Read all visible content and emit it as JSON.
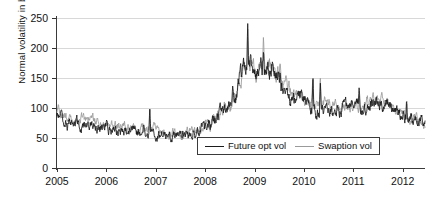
{
  "chart_data": {
    "type": "line",
    "title": "",
    "xlabel": "",
    "ylabel": "Normal volatility in bp",
    "xlim": [
      2005.0,
      2012.45
    ],
    "ylim": [
      0,
      250
    ],
    "grid": true,
    "legend_position": "bottom-center",
    "x_ticks": [
      "2005",
      "2006",
      "2007",
      "2008",
      "2009",
      "2010",
      "2011",
      "2012"
    ],
    "x_tick_values": [
      2005,
      2006,
      2007,
      2008,
      2009,
      2010,
      2011,
      2012
    ],
    "y_ticks": [
      "0",
      "50",
      "100",
      "150",
      "200",
      "250"
    ],
    "y_tick_values": [
      0,
      50,
      100,
      150,
      200,
      250
    ],
    "series": [
      {
        "name": "Future opt vol",
        "color": "#1b1b1b",
        "x": [
          2005.0,
          2005.04,
          2005.08,
          2005.12,
          2005.16,
          2005.2,
          2005.24,
          2005.28,
          2005.32,
          2005.36,
          2005.4,
          2005.44,
          2005.48,
          2005.52,
          2005.56,
          2005.6,
          2005.64,
          2005.68,
          2005.72,
          2005.76,
          2005.8,
          2005.84,
          2005.88,
          2005.92,
          2005.96,
          2006.0,
          2006.04,
          2006.08,
          2006.12,
          2006.16,
          2006.2,
          2006.24,
          2006.28,
          2006.32,
          2006.36,
          2006.4,
          2006.44,
          2006.48,
          2006.52,
          2006.56,
          2006.6,
          2006.64,
          2006.68,
          2006.72,
          2006.76,
          2006.8,
          2006.84,
          2006.88,
          2006.92,
          2006.96,
          2007.0,
          2007.04,
          2007.08,
          2007.12,
          2007.16,
          2007.2,
          2007.24,
          2007.28,
          2007.32,
          2007.36,
          2007.4,
          2007.44,
          2007.48,
          2007.52,
          2007.56,
          2007.6,
          2007.64,
          2007.68,
          2007.72,
          2007.76,
          2007.8,
          2007.84,
          2007.88,
          2007.92,
          2007.96,
          2008.0,
          2008.04,
          2008.08,
          2008.12,
          2008.16,
          2008.2,
          2008.24,
          2008.28,
          2008.32,
          2008.36,
          2008.4,
          2008.44,
          2008.48,
          2008.52,
          2008.56,
          2008.6,
          2008.64,
          2008.68,
          2008.72,
          2008.76,
          2008.8,
          2008.84,
          2008.88,
          2008.92,
          2008.96,
          2009.0,
          2009.04,
          2009.08,
          2009.12,
          2009.16,
          2009.2,
          2009.24,
          2009.28,
          2009.32,
          2009.36,
          2009.4,
          2009.44,
          2009.48,
          2009.52,
          2009.56,
          2009.6,
          2009.64,
          2009.68,
          2009.72,
          2009.76,
          2009.8,
          2009.84,
          2009.88,
          2009.92,
          2009.96,
          2010.0,
          2010.04,
          2010.08,
          2010.12,
          2010.16,
          2010.2,
          2010.24,
          2010.28,
          2010.32,
          2010.36,
          2010.4,
          2010.44,
          2010.48,
          2010.52,
          2010.56,
          2010.6,
          2010.64,
          2010.68,
          2010.72,
          2010.76,
          2010.8,
          2010.84,
          2010.88,
          2010.92,
          2010.96,
          2011.0,
          2011.04,
          2011.08,
          2011.12,
          2011.16,
          2011.2,
          2011.24,
          2011.28,
          2011.32,
          2011.36,
          2011.4,
          2011.44,
          2011.48,
          2011.52,
          2011.56,
          2011.6,
          2011.64,
          2011.68,
          2011.72,
          2011.76,
          2011.8,
          2011.84,
          2011.88,
          2011.92,
          2011.96,
          2012.0,
          2012.04,
          2012.08,
          2012.12,
          2012.16,
          2012.2,
          2012.24,
          2012.28,
          2012.32,
          2012.4
        ],
        "values": [
          78,
          82,
          76,
          72,
          80,
          74,
          70,
          76,
          72,
          68,
          74,
          70,
          66,
          72,
          68,
          64,
          70,
          66,
          62,
          68,
          64,
          60,
          66,
          62,
          58,
          64,
          60,
          66,
          62,
          58,
          64,
          60,
          56,
          62,
          58,
          54,
          60,
          56,
          62,
          58,
          54,
          60,
          56,
          52,
          58,
          54,
          60,
          56,
          52,
          58,
          54,
          60,
          56,
          52,
          100,
          62,
          58,
          54,
          60,
          56,
          48,
          54,
          50,
          56,
          52,
          48,
          54,
          58,
          54,
          50,
          56,
          52,
          58,
          54,
          60,
          56,
          62,
          58,
          64,
          60,
          56,
          62,
          58,
          64,
          60,
          66,
          52,
          58,
          64,
          70,
          66,
          72,
          68,
          74,
          70,
          66,
          62,
          58,
          64,
          60,
          56,
          62,
          68,
          74,
          80,
          86,
          92,
          88,
          94,
          100,
          96,
          102,
          108,
          114,
          110,
          116,
          122,
          118,
          124,
          130,
          126,
          132,
          128,
          134,
          130,
          136,
          130,
          124,
          130,
          136,
          142,
          138,
          144,
          150,
          156,
          162,
          158,
          164,
          170,
          176,
          182,
          178,
          184,
          190,
          196,
          202,
          198,
          192,
          186,
          180,
          174,
          168,
          162,
          156,
          150,
          144,
          150,
          156,
          162,
          168,
          174,
          180,
          186,
          192,
          186,
          180,
          174,
          168,
          162,
          168,
          174,
          180,
          186,
          180,
          174,
          168,
          162,
          156,
          150,
          144,
          138,
          132,
          126,
          120,
          114
        ],
        "values_note": "abbreviated representative sampling; actual rendering uses dense path"
      },
      {
        "name": "Swaption vol",
        "color": "#9a9a9a",
        "values_note": "gray series tracks Future opt vol closely, running slightly above it 2005-2006 and 2009-2011"
      }
    ],
    "key_values": {
      "start_2005": 80,
      "trough_2007": 48,
      "peak_late_2008": 235,
      "secondary_peak_2009": 195,
      "end_2012": 72
    }
  },
  "legend": {
    "entries": [
      {
        "label": "Future opt vol",
        "color": "#1b1b1b"
      },
      {
        "label": "Swaption vol",
        "color": "#9a9a9a"
      }
    ]
  }
}
